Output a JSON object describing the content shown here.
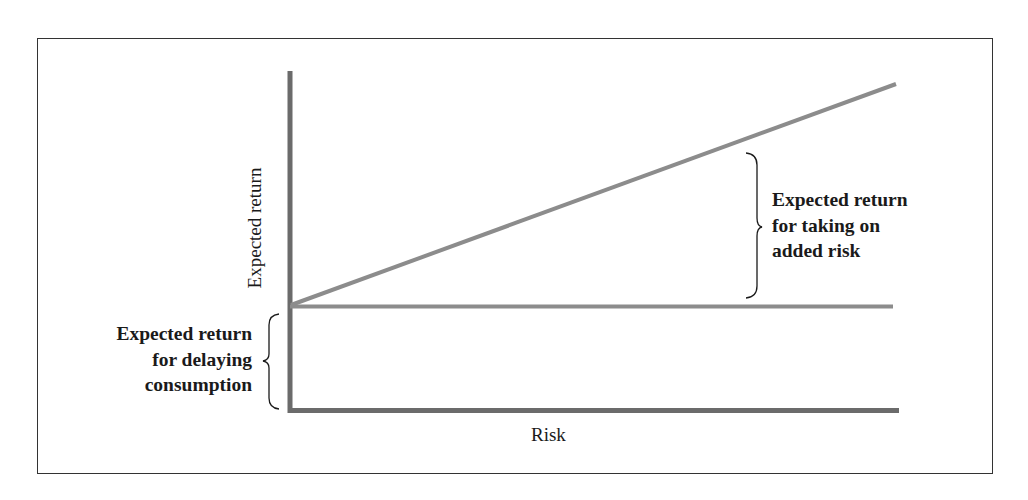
{
  "diagram": {
    "axes": {
      "y_label": "Expected return",
      "x_label": "Risk"
    },
    "lines": [
      {
        "name": "risk-return-line",
        "description": "upward sloping expected return line"
      },
      {
        "name": "risk-free-line",
        "description": "horizontal risk-free return level"
      }
    ],
    "annotations": {
      "risk_premium": {
        "lines": [
          "Expected return",
          "for taking on",
          "added risk"
        ]
      },
      "time_value": {
        "lines": [
          "Expected return",
          "for delaying",
          "consumption"
        ]
      }
    },
    "colors": {
      "axis": "#6b6b6b",
      "data_line": "#8c8c8c",
      "frame": "#333333",
      "text": "#1a1a1a"
    }
  }
}
